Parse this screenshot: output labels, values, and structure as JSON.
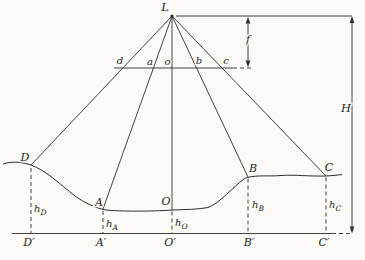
{
  "figure": {
    "colors": {
      "stroke": "#2e2c28",
      "background": "#fbfaf6"
    },
    "apex_label": "L",
    "focal_label": "f",
    "flight_height_label": "H",
    "image_plane_points": [
      "d",
      "a",
      "o",
      "b",
      "c"
    ],
    "ground_points": [
      "D",
      "A",
      "O",
      "B",
      "C"
    ],
    "datum_points": [
      "D′",
      "A′",
      "O′",
      "B′",
      "C′"
    ],
    "heights": [
      {
        "base": "h",
        "sub": "D"
      },
      {
        "base": "h",
        "sub": "A"
      },
      {
        "base": "h",
        "sub": "O"
      },
      {
        "base": "h",
        "sub": "B"
      },
      {
        "base": "h",
        "sub": "C"
      }
    ]
  }
}
